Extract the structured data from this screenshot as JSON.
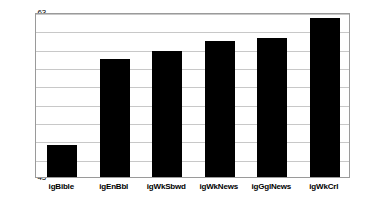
{
  "chart_data": {
    "type": "bar",
    "title": "",
    "subtitle": "",
    "xlabel": "",
    "ylabel": "",
    "categories": [
      "igBible",
      "igEnBbl",
      "igWkSbwd",
      "igWkNews",
      "igGglNews",
      "igWkCrl"
    ],
    "values": [
      48.5,
      57.9,
      58.8,
      59.8,
      60.2,
      62.3
    ],
    "ylim": [
      45,
      63
    ],
    "ytick_labels": [
      "45",
      "47",
      "49",
      "51",
      "53",
      "55",
      "57",
      "59",
      "61",
      "63"
    ],
    "ytick_values": [
      45,
      47,
      49,
      51,
      53,
      55,
      57,
      59,
      61,
      63
    ],
    "ystep": 2,
    "grid": true,
    "grid_axis": "y",
    "legend": false,
    "legend_position": "none",
    "series": [
      {
        "name": "",
        "values": [
          48.5,
          57.9,
          58.8,
          59.8,
          60.2,
          62.3
        ]
      }
    ],
    "colors": {
      "bar": "#000000",
      "grid": "#c8c8c8",
      "axis": "#9a9a9a",
      "background": "#ffffff",
      "text": "#000000"
    }
  }
}
